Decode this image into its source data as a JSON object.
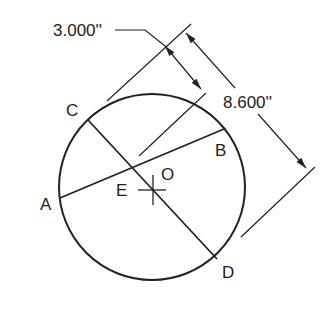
{
  "diagram": {
    "type": "circle-chord-dimension",
    "points": {
      "A": "A",
      "B": "B",
      "C": "C",
      "D": "D",
      "E": "E",
      "O": "O"
    },
    "dimensions": {
      "small": "3.000''",
      "large": "8.600''"
    },
    "colors": {
      "stroke": "#222222",
      "background": "#ffffff"
    }
  }
}
